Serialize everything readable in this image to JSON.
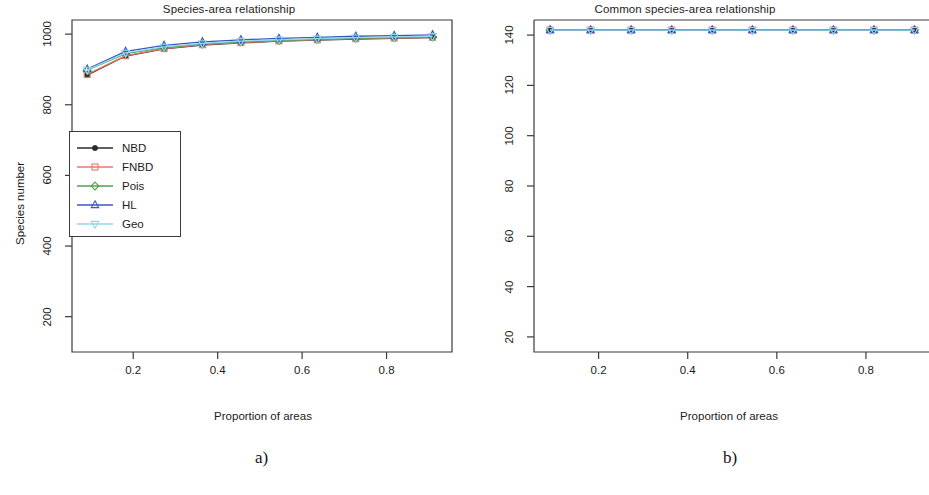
{
  "figure": {
    "panels": [
      {
        "id": "a",
        "caption": "a)",
        "title": "Species-area relationship",
        "xlabel": "Proportion of areas",
        "ylabel": "Species number"
      },
      {
        "id": "b",
        "caption": "b)",
        "title": "Common species-area relationship",
        "xlabel": "Proportion of areas",
        "ylabel": "Species number"
      }
    ]
  },
  "legend": {
    "entries": [
      {
        "label": "NBD",
        "color": "#2b2b2b",
        "marker": "circle-filled-icon"
      },
      {
        "label": "FNBD",
        "color": "#e8796b",
        "marker": "square-icon"
      },
      {
        "label": "Pois",
        "color": "#4ea24e",
        "marker": "diamond-icon"
      },
      {
        "label": "HL",
        "color": "#3a56c4",
        "marker": "triangle-up-icon"
      },
      {
        "label": "Geo",
        "color": "#8fd8e8",
        "marker": "triangle-down-icon"
      }
    ]
  },
  "chart_data": [
    {
      "type": "line",
      "panel": "a",
      "title": "Species-area relationship",
      "xlabel": "Proportion of areas",
      "ylabel": "Species number",
      "xlim": [
        0.055,
        0.955
      ],
      "ylim": [
        100,
        1040
      ],
      "xticks": [
        0.2,
        0.4,
        0.6,
        0.8
      ],
      "xtick_labels": [
        "0.2",
        "0.4",
        "0.6",
        "0.8"
      ],
      "yticks": [
        200,
        400,
        600,
        800,
        1000
      ],
      "ytick_labels": [
        "200",
        "400",
        "600",
        "800",
        "1000"
      ],
      "grid": false,
      "legend_position": "center-left",
      "x": [
        0.091,
        0.182,
        0.273,
        0.364,
        0.455,
        0.545,
        0.636,
        0.727,
        0.818,
        0.909
      ],
      "series": [
        {
          "name": "NBD",
          "values": [
            884,
            938,
            958,
            969,
            975,
            980,
            983,
            986,
            988,
            990
          ]
        },
        {
          "name": "FNBD",
          "values": [
            886,
            939,
            959,
            970,
            976,
            981,
            984,
            987,
            989,
            991
          ]
        },
        {
          "name": "Pois",
          "values": [
            898,
            945,
            962,
            972,
            978,
            982,
            985,
            988,
            990,
            992
          ]
        },
        {
          "name": "HL",
          "values": [
            901,
            951,
            968,
            978,
            984,
            988,
            991,
            994,
            996,
            998
          ]
        },
        {
          "name": "Geo",
          "values": [
            899,
            947,
            964,
            974,
            980,
            984,
            987,
            990,
            992,
            994
          ]
        }
      ]
    },
    {
      "type": "line",
      "panel": "b",
      "title": "Common species-area relationship",
      "xlabel": "Proportion of areas",
      "ylabel": "Species number",
      "xlim": [
        0.055,
        0.955
      ],
      "ylim": [
        14,
        146
      ],
      "xticks": [
        0.2,
        0.4,
        0.6,
        0.8
      ],
      "xtick_labels": [
        "0.2",
        "0.4",
        "0.6",
        "0.8"
      ],
      "yticks": [
        20,
        40,
        60,
        80,
        100,
        120,
        140
      ],
      "ytick_labels": [
        "20",
        "40",
        "60",
        "80",
        "100",
        "120",
        "140"
      ],
      "grid": false,
      "legend_position": "center-left",
      "x": [
        0.091,
        0.182,
        0.273,
        0.364,
        0.455,
        0.545,
        0.636,
        0.727,
        0.818,
        0.909
      ],
      "series": [
        {
          "name": "NBD",
          "values": [
            142,
            142,
            142,
            142,
            142,
            142,
            142,
            142,
            142,
            142
          ]
        },
        {
          "name": "FNBD",
          "values": [
            142,
            142,
            142,
            142,
            142,
            142,
            142,
            142,
            142,
            142
          ]
        },
        {
          "name": "Pois",
          "values": [
            142,
            142,
            142,
            142,
            142,
            142,
            142,
            142,
            142,
            142
          ]
        },
        {
          "name": "HL",
          "values": [
            142,
            142,
            142,
            142,
            142,
            142,
            142,
            142,
            142,
            142
          ]
        },
        {
          "name": "Geo",
          "values": [
            142,
            142,
            142,
            142,
            142,
            142,
            142,
            142,
            142,
            142
          ]
        }
      ]
    }
  ]
}
